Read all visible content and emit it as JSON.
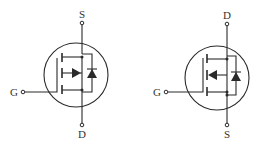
{
  "diagram": {
    "type": "MOSFET schematic symbols",
    "colors": {
      "stroke": "#2a2a2a",
      "label": "#333333",
      "background": "#ffffff"
    },
    "symbols": [
      {
        "id": "left",
        "channel": "N-channel style (arrow pointing toward channel)",
        "labels": {
          "top": "S",
          "bottom": "D",
          "gate": "G"
        },
        "has_body_diode": true
      },
      {
        "id": "right",
        "channel": "P-channel style (arrow pointing away from channel)",
        "labels": {
          "top": "D",
          "bottom": "S",
          "gate": "G"
        },
        "has_body_diode": true
      }
    ]
  }
}
